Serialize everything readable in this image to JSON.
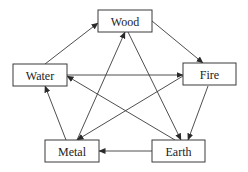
{
  "diagram": {
    "type": "directed-graph",
    "nodes": [
      {
        "id": "wood",
        "label": "Wood",
        "x": 98,
        "y": 10,
        "w": 54,
        "h": 22
      },
      {
        "id": "water",
        "label": "Water",
        "x": 13,
        "y": 64,
        "w": 54,
        "h": 22
      },
      {
        "id": "fire",
        "label": "Fire",
        "x": 183,
        "y": 63,
        "w": 53,
        "h": 22
      },
      {
        "id": "metal",
        "label": "Metal",
        "x": 45,
        "y": 140,
        "w": 54,
        "h": 22
      },
      {
        "id": "earth",
        "label": "Earth",
        "x": 152,
        "y": 140,
        "w": 53,
        "h": 22
      }
    ],
    "edges": [
      {
        "from": "water",
        "to": "wood",
        "x1": 45,
        "y1": 64,
        "x2": 98,
        "y2": 23
      },
      {
        "from": "wood",
        "to": "fire",
        "x1": 152,
        "y1": 21,
        "x2": 203,
        "y2": 63
      },
      {
        "from": "fire",
        "to": "earth",
        "x1": 208,
        "y1": 86,
        "x2": 188,
        "y2": 140
      },
      {
        "from": "earth",
        "to": "metal",
        "x1": 152,
        "y1": 151,
        "x2": 99,
        "y2": 151
      },
      {
        "from": "metal",
        "to": "water",
        "x1": 66,
        "y1": 140,
        "x2": 45,
        "y2": 86
      },
      {
        "from": "water",
        "to": "fire",
        "x1": 67,
        "y1": 75,
        "x2": 183,
        "y2": 75
      },
      {
        "from": "earth",
        "to": "water",
        "x1": 175,
        "y1": 140,
        "x2": 67,
        "y2": 76
      },
      {
        "from": "wood",
        "to": "earth",
        "x1": 128,
        "y1": 32,
        "x2": 181,
        "y2": 140
      },
      {
        "from": "metal",
        "to": "wood",
        "x1": 77,
        "y1": 140,
        "x2": 125,
        "y2": 32
      },
      {
        "from": "fire",
        "to": "metal",
        "x1": 183,
        "y1": 76,
        "x2": 77,
        "y2": 140
      }
    ],
    "colors": {
      "stroke": "#3a3a3a",
      "text": "#222222",
      "background": "#ffffff"
    }
  }
}
